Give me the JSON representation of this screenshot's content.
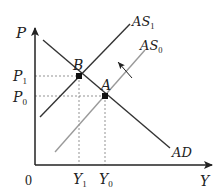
{
  "diagram": {
    "type": "AS-AD model (aggregate supply shift)",
    "axes": {
      "y_label": "P",
      "x_label": "Y",
      "origin_label": "0"
    },
    "price_levels": {
      "p1": {
        "base": "P",
        "sub": "1"
      },
      "p0": {
        "base": "P",
        "sub": "0"
      }
    },
    "output_levels": {
      "y1": {
        "base": "Y",
        "sub": "1"
      },
      "y0": {
        "base": "Y",
        "sub": "0"
      }
    },
    "curves": {
      "ad": {
        "label": "AD",
        "color": "#333333"
      },
      "as1": {
        "base": "AS",
        "sub": "1",
        "color": "#333333"
      },
      "as0": {
        "base": "AS",
        "sub": "0",
        "color": "#9a9a9a"
      }
    },
    "points": {
      "b": {
        "label": "B"
      },
      "a": {
        "label": "A"
      }
    },
    "shift_arrow": {
      "direction": "AS0 to AS1 (leftward/upward shift)"
    }
  }
}
